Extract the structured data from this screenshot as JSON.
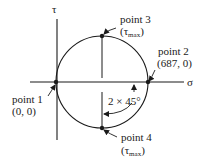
{
  "diagram": {
    "type": "mohr-circle",
    "axes": {
      "horizontal_label": "σ",
      "vertical_label": "τ"
    },
    "points": [
      {
        "id": "point1",
        "label": "point 1",
        "coords": "(0, 0)"
      },
      {
        "id": "point2",
        "label": "point 2",
        "coords": "(687, 0)"
      },
      {
        "id": "point3",
        "label": "point 3",
        "coords_prefix": "(τ",
        "coords_sub": "max",
        "coords_suffix": ")"
      },
      {
        "id": "point4",
        "label": "point 4",
        "coords_prefix": "(τ",
        "coords_sub": "max",
        "coords_suffix": ")"
      }
    ],
    "angle_label": "2 × 45°"
  }
}
